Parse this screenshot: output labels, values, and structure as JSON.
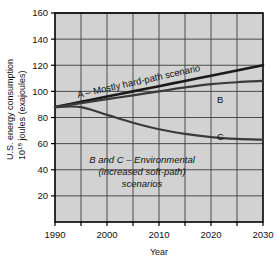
{
  "chart_data": {
    "type": "line",
    "title": "",
    "xlabel": "Year",
    "ylabel_line1": "U.S. energy consumption",
    "ylabel_line2_pre": "10",
    "ylabel_line2_sup": "18",
    "ylabel_line2_post": " joules (exajoules)",
    "xlim": [
      1990,
      2030
    ],
    "ylim": [
      0,
      160
    ],
    "xticks": [
      "1990",
      "2000",
      "2010",
      "2020",
      "2030"
    ],
    "xtick_values": [
      1990,
      2000,
      2010,
      2020,
      2030
    ],
    "xminor_values": [
      1995,
      2005,
      2015,
      2025
    ],
    "yticks": [
      "20",
      "40",
      "60",
      "80",
      "100",
      "120",
      "140",
      "160"
    ],
    "ytick_values": [
      20,
      40,
      60,
      80,
      100,
      120,
      140,
      160
    ],
    "grid": true,
    "legend_position": "inline-annotations",
    "series": [
      {
        "name": "A",
        "label": "A – Mostly hard-path scenario",
        "color": "#1a1a1a",
        "width": 2.6,
        "x": [
          1990,
          1995,
          2000,
          2005,
          2010,
          2015,
          2020,
          2025,
          2030
        ],
        "values": [
          88,
          92,
          96,
          100,
          104,
          108,
          112,
          116,
          120
        ]
      },
      {
        "name": "B",
        "label": "B",
        "color": "#3a3a3a",
        "width": 2.2,
        "x": [
          1990,
          1995,
          2000,
          2005,
          2010,
          2015,
          2020,
          2025,
          2030
        ],
        "values": [
          88,
          91,
          94,
          97,
          100,
          103,
          105.5,
          107,
          108
        ]
      },
      {
        "name": "C",
        "label": "C",
        "color": "#3a3a3a",
        "width": 2.2,
        "x": [
          1990,
          1995,
          2000,
          2005,
          2010,
          2015,
          2020,
          2025,
          2030
        ],
        "values": [
          88,
          88,
          82,
          76,
          71,
          67.5,
          65,
          63.6,
          63
        ]
      }
    ],
    "annotations": [
      {
        "name": "series-a-inline-label",
        "text": "A – Mostly hard-path scenario"
      },
      {
        "name": "series-b-label",
        "text": "B"
      },
      {
        "name": "series-c-label",
        "text": "C"
      },
      {
        "name": "environmental-note-line1",
        "text": "B and C – Environmental"
      },
      {
        "name": "environmental-note-line2",
        "text": "(increased soft-path)"
      },
      {
        "name": "environmental-note-line3",
        "text": "scenarios"
      }
    ],
    "colors": {
      "plot_background": "#d2d2d2",
      "grid": "#3c3c3c",
      "axis": "#000000",
      "page_background": "#ffffff",
      "text": "#111111"
    }
  }
}
